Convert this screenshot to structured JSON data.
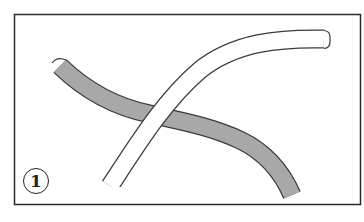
{
  "diagram": {
    "step_number": "1",
    "frame_color": "#2a2a2a",
    "rope_gray_fill": "#a8a8a8",
    "rope_white_fill": "#ffffff",
    "outline_color": "#3a3a3a"
  }
}
